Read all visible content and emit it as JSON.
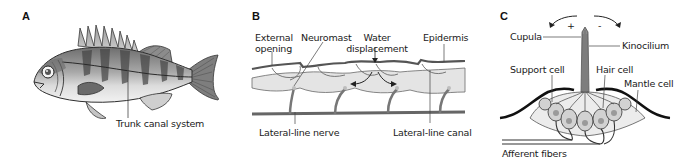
{
  "figure": {
    "panels": [
      {
        "letter": "A",
        "subject": "fish",
        "labels": {
          "trunk_canal": "Trunk canal system"
        }
      },
      {
        "letter": "B",
        "subject": "lateral-line canal cross-section",
        "labels": {
          "external_opening_1": "External",
          "external_opening_2": "opening",
          "neuromast": "Neuromast",
          "water_1": "Water",
          "water_2": "displacement",
          "epidermis": "Epidermis",
          "nerve": "Lateral-line nerve",
          "canal": "Lateral-line canal"
        }
      },
      {
        "letter": "C",
        "subject": "neuromast",
        "labels": {
          "plus": "+",
          "minus": "-",
          "cupula": "Cupula",
          "kinocilium": "Kinocilium",
          "support_cell": "Support cell",
          "hair_cell": "Hair cell",
          "mantle_cell": "Mantle cell",
          "afferent": "Afferent fibers"
        }
      }
    ],
    "colors": {
      "line": "#2b2b2b",
      "dark_gray": "#555555",
      "mid_gray": "#8a8a8a",
      "light_gray": "#d9d9d9",
      "canal_fill": "#e6e6e6",
      "cell_fill": "#c8c8c8"
    }
  }
}
